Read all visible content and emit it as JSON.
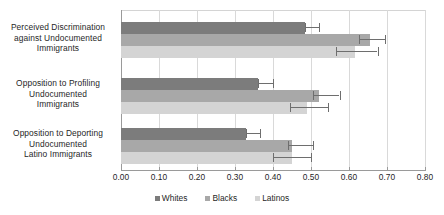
{
  "chart_data": {
    "type": "bar",
    "orientation": "horizontal",
    "title": "",
    "xlabel": "",
    "ylabel": "",
    "xlim": [
      0.0,
      0.8
    ],
    "grid": true,
    "legend_position": "bottom",
    "categories": [
      "Perceived Discrimination against Undocumented Immigrants",
      "Opposition to Profiling Undocumented Immigrants",
      "Opposition to Deporting Undocumented Latino Immigrants"
    ],
    "category_lines": [
      [
        "Perceived Discrimination",
        "against Undocumented",
        "Immigrants"
      ],
      [
        "Opposition to Profiling",
        "Undocumented",
        "Immigrants"
      ],
      [
        "Opposition to Deporting",
        "Undocumented",
        "Latino Immigrants"
      ]
    ],
    "series": [
      {
        "name": "Whites",
        "color": "#7c7c7c",
        "values": [
          0.485,
          0.36,
          0.33
        ],
        "err_low": [
          0.485,
          0.36,
          0.33
        ],
        "err_high": [
          0.52,
          0.4,
          0.365
        ]
      },
      {
        "name": "Blacks",
        "color": "#a8a8a8",
        "values": [
          0.655,
          0.52,
          0.45
        ],
        "err_low": [
          0.625,
          0.505,
          0.44
        ],
        "err_high": [
          0.695,
          0.575,
          0.505
        ]
      },
      {
        "name": "Latinos",
        "color": "#d4d4d4",
        "values": [
          0.615,
          0.49,
          0.45
        ],
        "err_low": [
          0.565,
          0.445,
          0.4
        ],
        "err_high": [
          0.675,
          0.545,
          0.5
        ]
      }
    ],
    "xticks": [
      "0.00",
      "0.10",
      "0.20",
      "0.30",
      "0.40",
      "0.50",
      "0.60",
      "0.70",
      "0.80"
    ],
    "xtick_values": [
      0.0,
      0.1,
      0.2,
      0.3,
      0.4,
      0.5,
      0.6,
      0.7,
      0.8
    ]
  },
  "legend": {
    "items": [
      {
        "label": "Whites",
        "color": "#7c7c7c"
      },
      {
        "label": "Blacks",
        "color": "#a8a8a8"
      },
      {
        "label": "Latinos",
        "color": "#d4d4d4"
      }
    ]
  }
}
